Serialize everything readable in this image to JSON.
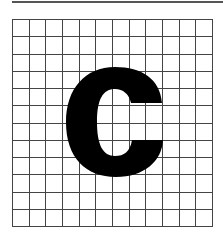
{
  "figure": {
    "letter": "C",
    "grid": {
      "columns": 12,
      "rows": 12
    },
    "colors": {
      "grid_line": "#444444",
      "letter_fill": "#000000",
      "background": "#ffffff",
      "top_rule": "#555555"
    }
  }
}
